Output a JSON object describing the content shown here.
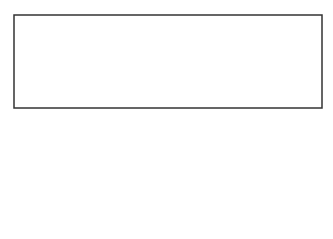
{
  "labels": {
    "height": "Height",
    "base": "Base",
    "shift": "Shift",
    "width": "Width"
  },
  "curve": {
    "points": "62,167 69,150 77,135 84,122 92,112 103,103 117,96 132,96 143,101 152,106 161,113 170,120 185,133 200,146 213,158 225,170 237,175 248,180 262,184 270,184 282,177",
    "stroke": "#555555"
  },
  "frame": {
    "stroke": "#333333"
  }
}
